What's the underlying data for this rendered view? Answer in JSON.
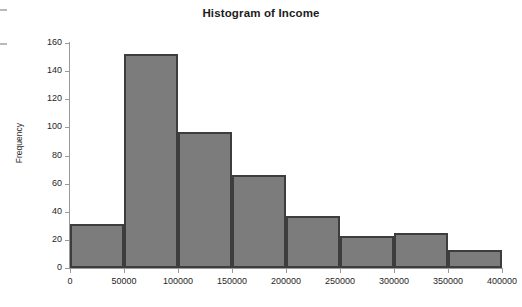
{
  "chart_data": {
    "type": "bar",
    "title": "Histogram of Income",
    "xlabel": "",
    "ylabel": "Frequency",
    "categories": [
      "0-50000",
      "50000-100000",
      "100000-150000",
      "150000-200000",
      "200000-250000",
      "250000-300000",
      "300000-350000",
      "350000-400000"
    ],
    "bin_edges": [
      0,
      50000,
      100000,
      150000,
      200000,
      250000,
      300000,
      350000,
      400000
    ],
    "values": [
      31,
      152,
      97,
      66,
      37,
      23,
      25,
      13
    ],
    "bin_width": 50000,
    "xlim": [
      0,
      400000
    ],
    "ylim": [
      0,
      160
    ],
    "x_ticks": [
      0,
      50000,
      100000,
      150000,
      200000,
      250000,
      300000,
      350000,
      400000
    ],
    "x_tick_labels": [
      "0",
      "50000",
      "100000",
      "150000",
      "200000",
      "250000",
      "300000",
      "350000",
      "400000"
    ],
    "y_ticks": [
      0,
      20,
      40,
      60,
      80,
      100,
      120,
      140,
      160
    ],
    "y_tick_labels": [
      "0",
      "20",
      "40",
      "60",
      "80",
      "100",
      "120",
      "140",
      "160"
    ],
    "grid": false,
    "legend": false,
    "bar_fill_color": "#7c7c7c",
    "bar_border_color": "#3d3d3d",
    "axis_color": "#9a9a9a",
    "background_color": "#ffffff",
    "title_color": "#1c1c1c"
  }
}
